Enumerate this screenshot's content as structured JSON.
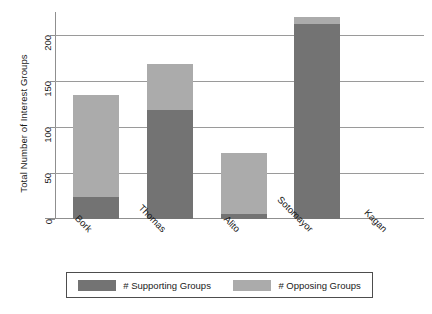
{
  "chart_data": {
    "type": "bar",
    "subtype": "stacked",
    "title": "",
    "xlabel": "",
    "ylabel": "Total Number of Interest Groups",
    "categories": [
      "Bork",
      "Thomas",
      "Alito",
      "Sotomayor",
      "Kagan"
    ],
    "series": [
      {
        "name": "# Supporting Groups",
        "color": "#737373",
        "values": [
          24,
          118,
          5,
          212,
          0
        ]
      },
      {
        "name": "# Opposing Groups",
        "color": "#ababab",
        "values": [
          111,
          50,
          67,
          8,
          0
        ]
      }
    ],
    "totals": [
      135,
      168,
      72,
      220,
      0
    ],
    "ylim": [
      0,
      225
    ],
    "yticks": [
      0,
      50,
      100,
      150,
      200
    ],
    "ytick_labels": [
      "0",
      "50",
      "100",
      "150",
      "200"
    ],
    "grid": "horizontal",
    "legend_position": "bottom",
    "axis_color": "#8f8f8f",
    "grid_color": "#9a9a9a",
    "background": "#ffffff"
  },
  "legend": {
    "entries": [
      {
        "label": "# Supporting Groups",
        "color": "#737373"
      },
      {
        "label": "# Opposing Groups",
        "color": "#ababab"
      }
    ]
  }
}
